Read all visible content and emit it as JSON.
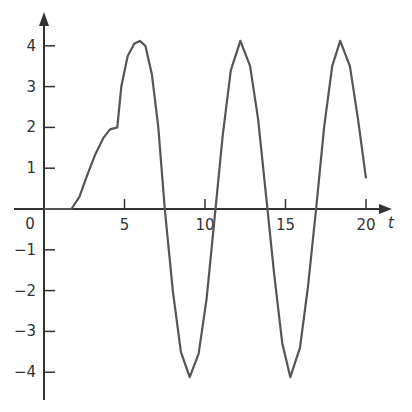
{
  "chart_data": {
    "type": "line",
    "title": "",
    "xlabel": "t",
    "ylabel": "",
    "xlim": [
      -2,
      21
    ],
    "ylim": [
      -4.7,
      4.7
    ],
    "grid": false,
    "x_ticks": [
      5,
      10,
      15,
      20
    ],
    "x_tick_labels": [
      "5",
      "10",
      "15",
      "20"
    ],
    "y_ticks": [
      4,
      3,
      2,
      1,
      -1,
      -2,
      -3,
      -4
    ],
    "y_tick_labels": [
      "4",
      "3",
      "2",
      "1",
      "−1",
      "−2",
      "−3",
      "−4"
    ],
    "origin_label": "0",
    "series": [
      {
        "name": "y(t)",
        "color": "#555555",
        "x": [
          0,
          1.7,
          2.2,
          2.7,
          3.2,
          3.7,
          4.1,
          4.55,
          4.8,
          5.2,
          5.6,
          5.95,
          6.3,
          6.7,
          7.1,
          7.5,
          8.0,
          8.5,
          9.05,
          9.6,
          10.1,
          10.6,
          11.1,
          11.6,
          12.2,
          12.8,
          13.3,
          13.8,
          14.3,
          14.8,
          15.3,
          15.9,
          16.4,
          16.9,
          17.4,
          17.9,
          18.4,
          19.0,
          19.5,
          20.0
        ],
        "y": [
          0,
          0,
          0.3,
          0.85,
          1.35,
          1.75,
          1.95,
          2.0,
          3.0,
          3.75,
          4.05,
          4.12,
          4.0,
          3.3,
          2.0,
          0.0,
          -2.0,
          -3.5,
          -4.12,
          -3.55,
          -2.2,
          -0.2,
          1.8,
          3.4,
          4.12,
          3.5,
          2.2,
          0.3,
          -1.6,
          -3.3,
          -4.12,
          -3.4,
          -1.9,
          0.0,
          2.0,
          3.5,
          4.12,
          3.5,
          2.2,
          0.75
        ]
      }
    ]
  }
}
